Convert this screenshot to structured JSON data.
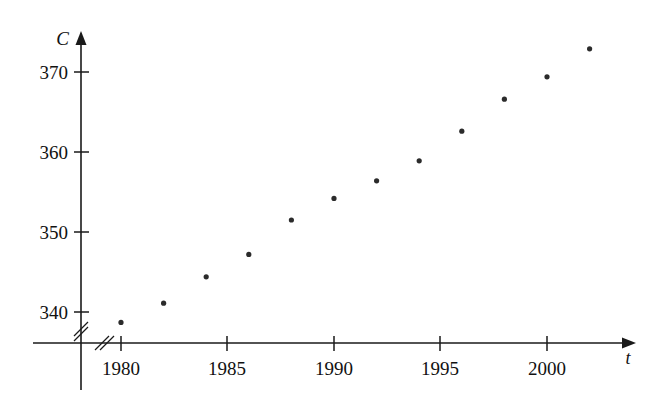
{
  "chart_data": {
    "type": "scatter",
    "title": "",
    "xlabel": "t",
    "ylabel": "C",
    "x": [
      1980,
      1982,
      1984,
      1986,
      1988,
      1990,
      1992,
      1994,
      1996,
      1998,
      2000,
      2002
    ],
    "values": [
      338.7,
      341.1,
      344.4,
      347.2,
      351.5,
      354.2,
      356.4,
      358.9,
      362.6,
      366.6,
      369.4,
      372.9
    ],
    "points": [
      {
        "x": 1980,
        "y": 338.7
      },
      {
        "x": 1982,
        "y": 341.1
      },
      {
        "x": 1984,
        "y": 344.4
      },
      {
        "x": 1986,
        "y": 347.2
      },
      {
        "x": 1988,
        "y": 351.5
      },
      {
        "x": 1990,
        "y": 354.2
      },
      {
        "x": 1992,
        "y": 356.4
      },
      {
        "x": 1994,
        "y": 358.9
      },
      {
        "x": 1996,
        "y": 362.6
      },
      {
        "x": 1998,
        "y": 366.6
      },
      {
        "x": 2000,
        "y": 369.4
      },
      {
        "x": 2002,
        "y": 372.9
      }
    ],
    "xticks": [
      1980,
      1985,
      1990,
      1995,
      2000
    ],
    "xtick_labels": [
      "1980",
      "1985",
      "1990",
      "1995",
      "2000"
    ],
    "yticks": [
      340,
      350,
      360,
      370
    ],
    "ytick_labels": [
      "340",
      "350",
      "360",
      "370"
    ],
    "xlim": [
      1978.2,
      2004.0
    ],
    "ylim": [
      334.0,
      374.5
    ],
    "grid": false,
    "legend": null,
    "axis_break_x": true,
    "axis_break_y": true,
    "marker_color": "#2b2b2b",
    "axis_color": "#1a1a1a"
  },
  "axis": {
    "y_label": "C",
    "x_label": "t",
    "y_tick_labels": [
      "370",
      "360",
      "350",
      "340"
    ],
    "x_tick_labels": [
      "1980",
      "1985",
      "1990",
      "1995",
      "2000"
    ]
  }
}
